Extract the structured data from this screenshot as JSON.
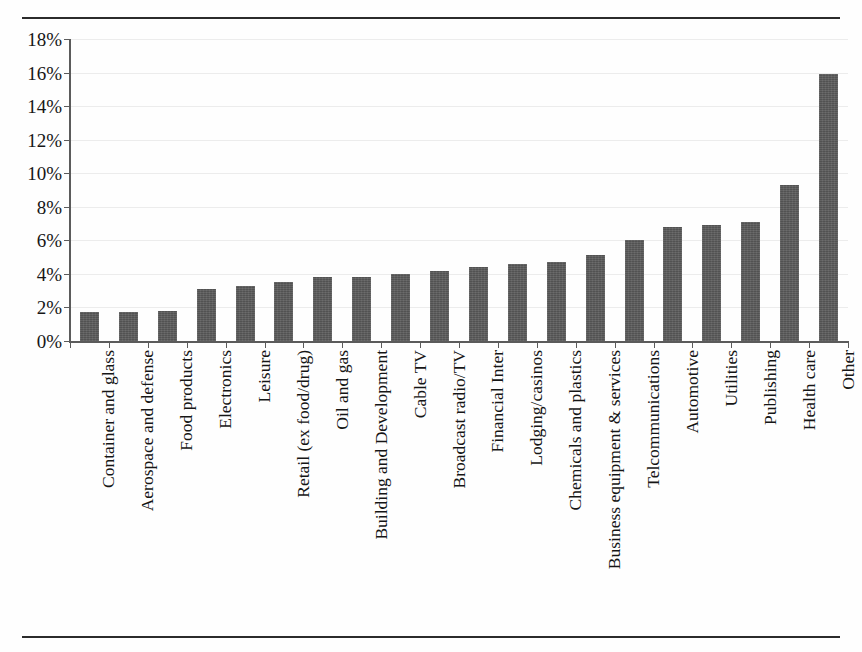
{
  "figure": {
    "title": "",
    "title_clipped_note": "",
    "background_color": "#fefefe",
    "bar_color": "#595959",
    "axis_color": "#5b5b5b",
    "gridline_color": "#ececec",
    "rules": [
      "top",
      "bottom"
    ]
  },
  "chart_data": {
    "type": "bar",
    "title": "",
    "xlabel": "",
    "ylabel": "",
    "ylim": [
      0,
      18
    ],
    "yticks": [
      0,
      2,
      4,
      6,
      8,
      10,
      12,
      14,
      16,
      18
    ],
    "ytick_labels": [
      "0%",
      "2%",
      "4%",
      "6%",
      "8%",
      "10%",
      "12%",
      "14%",
      "16%",
      "18%"
    ],
    "grid": true,
    "legend": null,
    "orientation": "vertical",
    "value_unit": "%",
    "categories": [
      "Container and glass",
      "Aerospace and defense",
      "Food products",
      "Electronics",
      "Leisure",
      "Retail (ex food/drug)",
      "Oil and gas",
      "Building and Development",
      "Cable TV",
      "Broadcast radio/TV",
      "Financial Inter",
      "Lodging/casinos",
      "Chemicals and plastics",
      "Business equipment & services",
      "Telcommunications",
      "Automotive",
      "Utilities",
      "Publishing",
      "Health care",
      "Other"
    ],
    "values": [
      1.7,
      1.7,
      1.8,
      3.1,
      3.3,
      3.5,
      3.8,
      3.8,
      4.0,
      4.2,
      4.4,
      4.6,
      4.7,
      5.1,
      6.0,
      6.8,
      6.9,
      7.1,
      9.3,
      15.9
    ]
  }
}
